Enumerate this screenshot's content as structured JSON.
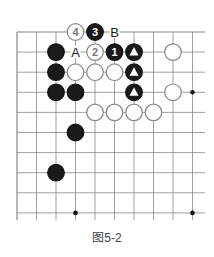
{
  "caption": "图5-2",
  "board": {
    "origin_x": 17,
    "origin_y": 32,
    "step_x": 19.5,
    "step_y": 20.1,
    "cols": 10,
    "rows": 10,
    "line_color": "#888888",
    "stones": [
      {
        "c": 3,
        "r": 0,
        "color": "white",
        "label": "4"
      },
      {
        "c": 4,
        "r": 0,
        "color": "black",
        "label": "3"
      },
      {
        "c": 2,
        "r": 1,
        "color": "black"
      },
      {
        "c": 4,
        "r": 1,
        "color": "white",
        "label": "2"
      },
      {
        "c": 5,
        "r": 1,
        "color": "black",
        "label": "1"
      },
      {
        "c": 6,
        "r": 1,
        "color": "black",
        "mark": "triangle"
      },
      {
        "c": 8,
        "r": 1,
        "color": "white"
      },
      {
        "c": 2,
        "r": 2,
        "color": "black"
      },
      {
        "c": 3,
        "r": 2,
        "color": "white"
      },
      {
        "c": 4,
        "r": 2,
        "color": "white"
      },
      {
        "c": 5,
        "r": 2,
        "color": "white"
      },
      {
        "c": 6,
        "r": 2,
        "color": "black",
        "mark": "triangle"
      },
      {
        "c": 2,
        "r": 3,
        "color": "black"
      },
      {
        "c": 3,
        "r": 3,
        "color": "black"
      },
      {
        "c": 6,
        "r": 3,
        "color": "black",
        "mark": "triangle"
      },
      {
        "c": 8,
        "r": 3,
        "color": "white"
      },
      {
        "c": 4,
        "r": 4,
        "color": "white"
      },
      {
        "c": 5,
        "r": 4,
        "color": "white"
      },
      {
        "c": 6,
        "r": 4,
        "color": "white"
      },
      {
        "c": 7,
        "r": 4,
        "color": "white"
      },
      {
        "c": 3,
        "r": 5,
        "color": "black"
      },
      {
        "c": 2,
        "r": 7,
        "color": "black"
      }
    ],
    "letters": [
      {
        "c": 5,
        "r": 0,
        "text": "B"
      },
      {
        "c": 3,
        "r": 1,
        "text": "A"
      }
    ],
    "hoshi": [
      {
        "c": 9,
        "r": 3
      },
      {
        "c": 3,
        "r": 9
      },
      {
        "c": 9,
        "r": 9
      }
    ]
  }
}
